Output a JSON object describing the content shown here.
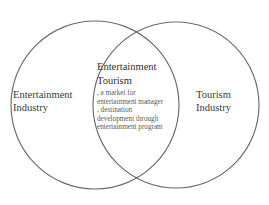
{
  "diagram": {
    "type": "venn-two-set",
    "background_color": "#ffffff",
    "stroke_color": "#6b6b6b",
    "text_color": "#333333",
    "left_set": {
      "name": "entertainment-industry",
      "lines": [
        "Entertainment",
        "Industry"
      ]
    },
    "right_set": {
      "name": "tourism-industry",
      "lines": [
        "Tourism",
        "Industry"
      ]
    },
    "intersection": {
      "name": "entertainment-tourism",
      "title_lines": [
        "Entertainment",
        "Tourism"
      ],
      "bullet_lines": [
        ", a market for",
        "entertainment manager",
        ", destination",
        "development through",
        "entertainment program"
      ]
    }
  },
  "geometry": {
    "left_circle": {
      "cx": 95,
      "cy": 105,
      "r": 84
    },
    "right_circle": {
      "cx": 176,
      "cy": 105,
      "r": 83
    }
  }
}
